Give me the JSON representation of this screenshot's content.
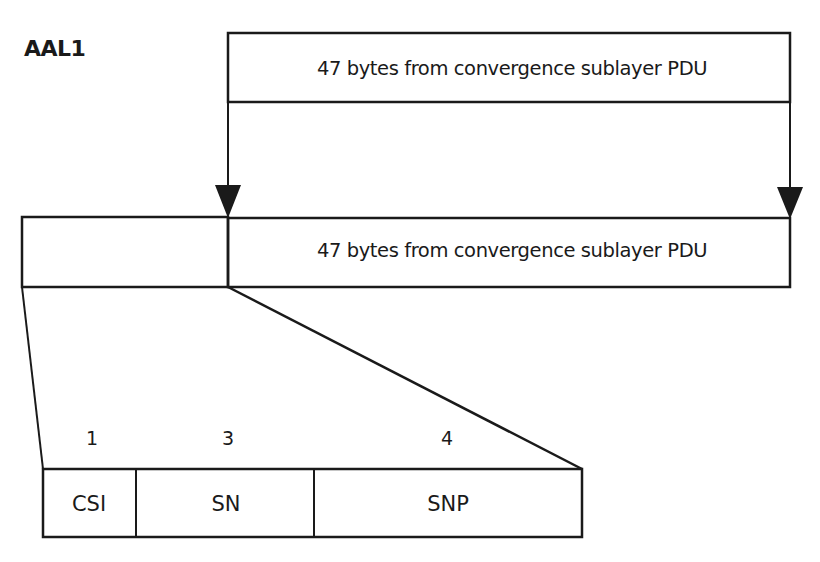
{
  "diagram": {
    "title": "AAL1",
    "source_box": {
      "label": "47 bytes from convergence sublayer PDU"
    },
    "cell": {
      "header_label": "",
      "payload_label": "47 bytes from convergence sublayer PDU"
    },
    "header_fields": [
      {
        "name": "CSI",
        "bits": "1"
      },
      {
        "name": "SN",
        "bits": "3"
      },
      {
        "name": "SNP",
        "bits": "4"
      }
    ],
    "colors": {
      "line": "#1a1a1a",
      "background": "#ffffff"
    }
  }
}
